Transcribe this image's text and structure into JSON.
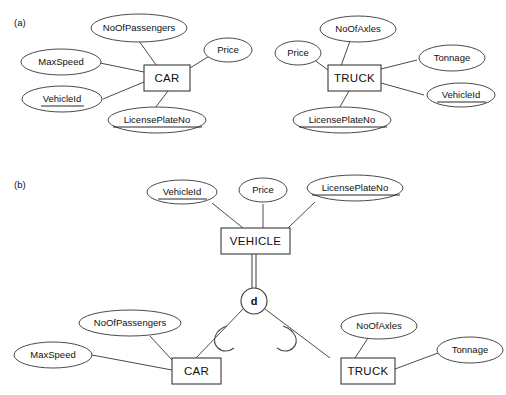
{
  "figure": {
    "part_a_label": "(a)",
    "part_b_label": "(b)"
  },
  "part_a": {
    "car": {
      "entity": "CAR",
      "attributes": [
        {
          "name": "NoOfPassengers",
          "key": false
        },
        {
          "name": "Price",
          "key": false
        },
        {
          "name": "MaxSpeed",
          "key": false
        },
        {
          "name": "VehicleId",
          "key": true
        },
        {
          "name": "LicensePlateNo",
          "key": true
        }
      ]
    },
    "truck": {
      "entity": "TRUCK",
      "attributes": [
        {
          "name": "NoOfAxles",
          "key": false
        },
        {
          "name": "Price",
          "key": false
        },
        {
          "name": "Tonnage",
          "key": false
        },
        {
          "name": "VehicleId",
          "key": true
        },
        {
          "name": "LicensePlateNo",
          "key": true
        }
      ]
    }
  },
  "part_b": {
    "superclass": {
      "entity": "VEHICLE",
      "attributes": [
        {
          "name": "VehicleId",
          "key": true
        },
        {
          "name": "Price",
          "key": false
        },
        {
          "name": "LicensePlateNo",
          "key": true
        }
      ]
    },
    "specialization": {
      "constraint_symbol": "d",
      "constraint_meaning": "disjoint",
      "participation": "total"
    },
    "subclasses": [
      {
        "entity": "CAR",
        "attributes": [
          {
            "name": "NoOfPassengers",
            "key": false
          },
          {
            "name": "MaxSpeed",
            "key": false
          }
        ]
      },
      {
        "entity": "TRUCK",
        "attributes": [
          {
            "name": "NoOfAxles",
            "key": false
          },
          {
            "name": "Tonnage",
            "key": false
          }
        ]
      }
    ]
  },
  "labels": {
    "a_NoOfPassengers": "NoOfPassengers",
    "a_Price": "Price",
    "a_MaxSpeed": "MaxSpeed",
    "a_VehicleId": "VehicleId",
    "a_LicensePlateNo": "LicensePlateNo",
    "a_CAR": "CAR",
    "a_TRUCK": "TRUCK",
    "a_NoOfAxles": "NoOfAxles",
    "a_TruckPrice": "Price",
    "a_Tonnage": "Tonnage",
    "a_TruckVehicleId": "VehicleId",
    "a_TruckLicensePlateNo": "LicensePlateNo",
    "b_VehicleId": "VehicleId",
    "b_Price": "Price",
    "b_LicensePlateNo": "LicensePlateNo",
    "b_VEHICLE": "VEHICLE",
    "b_d": "d",
    "b_CAR": "CAR",
    "b_TRUCK": "TRUCK",
    "b_NoOfPassengers": "NoOfPassengers",
    "b_MaxSpeed": "MaxSpeed",
    "b_NoOfAxles": "NoOfAxles",
    "b_Tonnage": "Tonnage"
  }
}
